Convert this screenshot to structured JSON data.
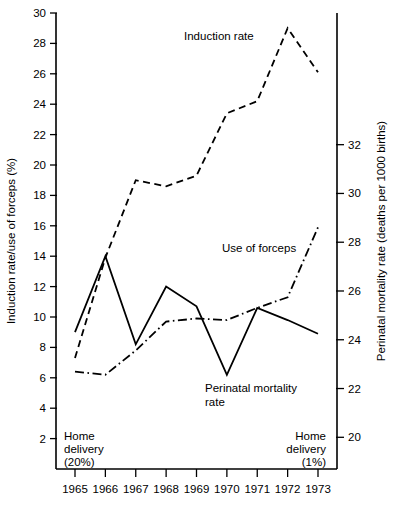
{
  "chart_data": {
    "type": "line",
    "title": "",
    "x": [
      1965,
      1966,
      1967,
      1968,
      1969,
      1970,
      1971,
      1972,
      1973
    ],
    "categories": [
      "1965",
      "1966",
      "1967",
      "1968",
      "1969",
      "1970",
      "1971",
      "1972",
      "1973"
    ],
    "xlabel": "",
    "grid": false,
    "legend_position": "inline-annotations",
    "axes": [
      {
        "id": "left",
        "label": "Induction rate/use of forceps (%)",
        "lim": [
          0,
          30
        ],
        "ticks": [
          2,
          4,
          6,
          8,
          10,
          12,
          14,
          16,
          18,
          20,
          22,
          24,
          26,
          28,
          30
        ],
        "tick_labels": [
          "2",
          "4",
          "6",
          "8",
          "10",
          "12",
          "14",
          "16",
          "18",
          "20",
          "22",
          "24",
          "26",
          "28",
          "30"
        ]
      },
      {
        "id": "right",
        "label": "Perinatal mortality rate (deaths per 1000 births)",
        "lim": [
          18.7,
          37.4
        ],
        "ticks": [
          20,
          22,
          24,
          26,
          28,
          30,
          32
        ],
        "tick_labels": [
          "20",
          "22",
          "24",
          "26",
          "28",
          "30",
          "32"
        ]
      }
    ],
    "series": [
      {
        "name": "Induction rate",
        "axis": "left",
        "style": "dashed",
        "unit": "%",
        "values": [
          7.3,
          13.9,
          19.0,
          18.6,
          19.3,
          23.4,
          24.2,
          29.0,
          26.1
        ]
      },
      {
        "name": "Use of forceps",
        "axis": "left",
        "style": "dash-dot",
        "unit": "%",
        "values": [
          6.4,
          6.2,
          7.8,
          9.7,
          9.9,
          9.8,
          10.6,
          11.3,
          15.9
        ]
      },
      {
        "name": "Perinatal mortality rate",
        "axis": "right",
        "style": "solid",
        "unit": "deaths per 1000 births",
        "left_axis_equivalent": [
          9.0,
          14.0,
          8.2,
          12.0,
          10.7,
          6.2,
          10.6,
          9.8,
          8.9
        ],
        "values": [
          24.3,
          27.4,
          23.8,
          26.4,
          25.4,
          22.6,
          25.4,
          24.9,
          24.1
        ]
      }
    ],
    "annotations": [
      {
        "id": "induction-rate-label",
        "text": "Induction rate"
      },
      {
        "id": "use-of-forceps-label",
        "text": "Use of forceps"
      },
      {
        "id": "perinatal-mortality-label-line1",
        "text": "Perinatal mortality"
      },
      {
        "id": "perinatal-mortality-label-line2",
        "text": "rate"
      },
      {
        "id": "home-delivery-left-line1",
        "text": "Home"
      },
      {
        "id": "home-delivery-left-line2",
        "text": "delivery"
      },
      {
        "id": "home-delivery-left-line3",
        "text": "(20%)"
      },
      {
        "id": "home-delivery-right-line1",
        "text": "Home"
      },
      {
        "id": "home-delivery-right-line2",
        "text": "delivery"
      },
      {
        "id": "home-delivery-right-line3",
        "text": "(1%)"
      }
    ],
    "colors": {
      "axis": "#000000",
      "series": "#000000",
      "background": "#ffffff"
    }
  }
}
